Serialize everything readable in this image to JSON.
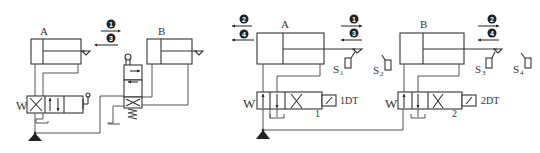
{
  "diagram": {
    "left_circuit": {
      "cylinder_a": {
        "label": "A"
      },
      "cylinder_b": {
        "label": "B"
      },
      "steps": [
        {
          "num": "1",
          "direction": "right"
        },
        {
          "num": "3",
          "direction": "left"
        }
      ]
    },
    "right_circuit": {
      "cylinder_a": {
        "label": "A",
        "steps_left": [
          {
            "num": "2",
            "direction": "left"
          },
          {
            "num": "4",
            "direction": "left"
          }
        ],
        "steps_right": [
          {
            "num": "1",
            "direction": "right"
          },
          {
            "num": "3",
            "direction": "left"
          }
        ]
      },
      "cylinder_b": {
        "label": "B",
        "steps_right": [
          {
            "num": "2",
            "direction": "right"
          },
          {
            "num": "4",
            "direction": "left"
          }
        ]
      },
      "switches": [
        {
          "label": "S",
          "sub": "1"
        },
        {
          "label": "S",
          "sub": "2"
        },
        {
          "label": "S",
          "sub": "3"
        },
        {
          "label": "S",
          "sub": "4"
        }
      ],
      "valve_1": {
        "number": "1",
        "solenoid": "1DT"
      },
      "valve_2": {
        "number": "2",
        "solenoid": "2DT"
      }
    },
    "colors": {
      "line": "#555555",
      "symbol": "#222222",
      "background": "#ffffff"
    }
  }
}
